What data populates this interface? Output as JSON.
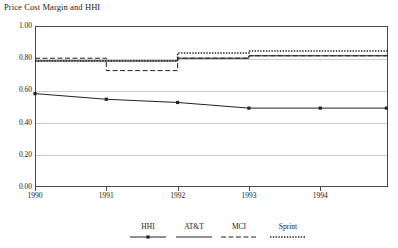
{
  "chart_data": {
    "type": "line",
    "title": "Price Cost Margin and HHI",
    "xlabel": "",
    "ylabel": "",
    "x": [
      1990,
      1991,
      1992,
      1993,
      1994
    ],
    "xtick_labels": [
      "1990",
      "1991",
      "1992",
      "1993",
      "1994"
    ],
    "ytick_labels": [
      "0.00",
      "0.20",
      "0.40",
      "0.60",
      "0.80",
      "1.00"
    ],
    "ytick_values": [
      0.0,
      0.2,
      0.4,
      0.6,
      0.8,
      1.0
    ],
    "ylim": [
      0.0,
      1.0
    ],
    "xlim": [
      1990,
      1994.95
    ],
    "grid": true,
    "legend_position": "bottom",
    "series": [
      {
        "name": "HHI",
        "style": "solid-with-markers",
        "marker": "square",
        "color": "#222222",
        "values": [
          0.58,
          0.545,
          0.525,
          0.49,
          0.49
        ]
      },
      {
        "name": "AT&T",
        "style": "solid",
        "color": "#222222",
        "values": [
          0.783,
          0.783,
          0.8,
          0.815,
          0.815
        ]
      },
      {
        "name": "MCI",
        "style": "dashed",
        "color": "#222222",
        "values": [
          0.8,
          0.723,
          0.8,
          0.815,
          0.815
        ]
      },
      {
        "name": "Sprint",
        "style": "dotted",
        "color": "#222222",
        "values": [
          0.783,
          0.783,
          0.832,
          0.845,
          0.845
        ]
      }
    ]
  },
  "legend": {
    "entries": [
      {
        "label": "HHI"
      },
      {
        "label": "AT&T"
      },
      {
        "label": "MCI"
      },
      {
        "label": "Sprint"
      }
    ]
  }
}
